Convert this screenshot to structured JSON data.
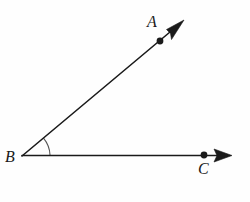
{
  "figure": {
    "type": "angle-diagram",
    "background_color": "#fefefe",
    "stroke_color": "#1a1a1a",
    "arc_color": "#555555",
    "labels": {
      "a": "A",
      "b": "B",
      "c": "C"
    },
    "points": {
      "vertex_b": {
        "x": 22,
        "y": 156
      },
      "point_a": {
        "x": 160,
        "y": 41
      },
      "point_c": {
        "x": 204,
        "y": 155
      },
      "ray_a_tip": {
        "x": 184,
        "y": 20
      },
      "ray_c_tip": {
        "x": 232,
        "y": 155
      }
    },
    "angle": {
      "measure_degrees": 40,
      "arc_radius": 28
    }
  }
}
